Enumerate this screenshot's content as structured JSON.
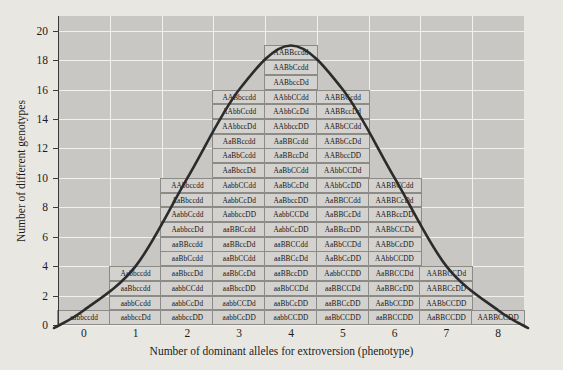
{
  "axes": {
    "ylabel": "Number of different genotypes",
    "xlabel": "Number of dominant alleles for extroversion (phenotype)",
    "yticks": [
      "0",
      "2",
      "4",
      "6",
      "8",
      "10",
      "12",
      "14",
      "16",
      "18",
      "20"
    ],
    "xticks": [
      "0",
      "1",
      "2",
      "3",
      "4",
      "5",
      "6",
      "7",
      "8"
    ],
    "ylim": [
      0,
      21
    ],
    "xlim": [
      -0.6,
      8.6
    ],
    "grid": true,
    "panel_color": "#c9c7c4",
    "gridline_color": "#f2f1ee",
    "background_color": "#e9e7e2",
    "box_fill": "#d4d2cf",
    "box_border": "#8d8b88",
    "curve_color": "#2b2b2b"
  },
  "chart_data": {
    "type": "bar",
    "title": "",
    "xlabel": "Number of dominant alleles for extroversion (phenotype)",
    "ylabel": "Number of different genotypes",
    "xlim": [
      -0.6,
      8.6
    ],
    "ylim": [
      0,
      21
    ],
    "grid": true,
    "categories": [
      "0",
      "1",
      "2",
      "3",
      "4",
      "5",
      "6",
      "7",
      "8"
    ],
    "values": [
      1,
      4,
      10,
      16,
      19,
      16,
      10,
      4,
      1
    ],
    "overlay": {
      "type": "line",
      "name": "distribution curve",
      "x": [
        0,
        1,
        2,
        3,
        4,
        5,
        6,
        7,
        8
      ],
      "y": [
        1,
        4,
        10,
        16,
        19,
        16,
        10,
        4,
        1
      ]
    }
  },
  "columns": [
    {
      "x": "0",
      "count": 1,
      "genotypes": [
        "aabbccdd"
      ]
    },
    {
      "x": "1",
      "count": 4,
      "genotypes": [
        "Aabbccdd",
        "aaBbccdd",
        "aabbCcdd",
        "aabbccDd"
      ]
    },
    {
      "x": "2",
      "count": 10,
      "genotypes": [
        "AAbbccdd",
        "AaBbccdd",
        "AabbCcdd",
        "AabbccDd",
        "aaBBccdd",
        "aaBbCcdd",
        "aaBbccDd",
        "aabbCCdd",
        "aabbCcDd",
        "aabbccDD"
      ]
    },
    {
      "x": "3",
      "count": 16,
      "genotypes": [
        "AABbccdd",
        "AAbbCcdd",
        "AAbbccDd",
        "AaBBccdd",
        "AaBbCcdd",
        "AaBbccDd",
        "AabbCCdd",
        "AabbCcDd",
        "AabbccDD",
        "aaBBCcdd",
        "aaBBccDd",
        "aaBbCCdd",
        "aaBbCcDd",
        "aaBbccDD",
        "aabbCCDd",
        "aabbCcDD"
      ]
    },
    {
      "x": "4",
      "count": 19,
      "genotypes": [
        "AABBccdd",
        "AABbCcdd",
        "AABbccDd",
        "AAbbCCdd",
        "AAbbCcDd",
        "AAbbccDD",
        "AaBBCcdd",
        "AaBBccDd",
        "AaBbCCdd",
        "AaBbCcDd",
        "AaBbccDD",
        "AabbCCDd",
        "AabbCcDD",
        "aaBBCCdd",
        "aaBBCcDd",
        "aaBBccDD",
        "aaBbCCDd",
        "aaBbCcDD",
        "aabbCCDD"
      ]
    },
    {
      "x": "5",
      "count": 16,
      "genotypes": [
        "AABBCcdd",
        "AABBccDd",
        "AABbCCdd",
        "AABbCcDd",
        "AABbccDD",
        "AAbbCCDd",
        "AAbbCcDD",
        "AaBBCCdd",
        "AaBBCcDd",
        "AaBBccDD",
        "AaBbCCDd",
        "AaBbCcDD",
        "AabbCCDD",
        "aaBBCCDd",
        "aaBBCcDD",
        "aaBbCCDD"
      ]
    },
    {
      "x": "6",
      "count": 10,
      "genotypes": [
        "AABBCCdd",
        "AABBCcDd",
        "AABBccDD",
        "AABbCCDd",
        "AABbCcDD",
        "AAbbCCDD",
        "AaBBCCDd",
        "AaBBCcDD",
        "AaBbCCDD",
        "aaBBCCDD"
      ]
    },
    {
      "x": "7",
      "count": 4,
      "genotypes": [
        "AABBCCDd",
        "AABBCcDD",
        "AABbCCDD",
        "AaBBCCDD"
      ]
    },
    {
      "x": "8",
      "count": 1,
      "genotypes": [
        "AABBCCDD"
      ]
    }
  ]
}
